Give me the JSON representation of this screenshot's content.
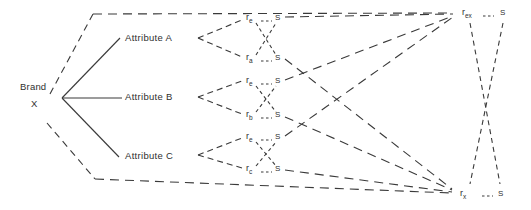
{
  "diagram": {
    "background": "#ffffff",
    "line_color": "#3a3a3a",
    "text_color": "#2f2f2f",
    "brand": {
      "line1": "Brand",
      "line2": "X"
    },
    "attributes": [
      {
        "label": "Attribute A"
      },
      {
        "label": "Attribute B"
      },
      {
        "label": "Attribute C"
      }
    ],
    "rating_groups": [
      {
        "rows": [
          {
            "symbol": "r",
            "subscript": "e",
            "scale_symbol": "S"
          },
          {
            "symbol": "r",
            "subscript": "a",
            "scale_symbol": "S"
          }
        ]
      },
      {
        "rows": [
          {
            "symbol": "r",
            "subscript": "e",
            "scale_symbol": "S"
          },
          {
            "symbol": "r",
            "subscript": "b",
            "scale_symbol": "S"
          }
        ]
      },
      {
        "rows": [
          {
            "symbol": "r",
            "subscript": "e",
            "scale_symbol": "S"
          },
          {
            "symbol": "r",
            "subscript": "c",
            "scale_symbol": "S"
          }
        ]
      }
    ],
    "overall": {
      "top": {
        "symbol": "r",
        "subscript": "ex",
        "scale_symbol": "S"
      },
      "bottom": {
        "symbol": "r",
        "subscript": "x",
        "scale_symbol": "S"
      }
    }
  }
}
